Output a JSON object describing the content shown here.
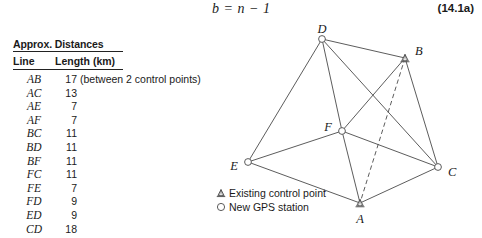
{
  "equation": {
    "formula": "b = n − 1",
    "number": "(14.1a)"
  },
  "table": {
    "title": "Approx. Distances",
    "headers": {
      "line": "Line",
      "length": "Length (km)"
    },
    "rows": [
      {
        "line": "AB",
        "length": "17",
        "note": "(between 2 control points)"
      },
      {
        "line": "AC",
        "length": "13",
        "note": ""
      },
      {
        "line": "AE",
        "length": "7",
        "note": ""
      },
      {
        "line": "AF",
        "length": "7",
        "note": ""
      },
      {
        "line": "BC",
        "length": "11",
        "note": ""
      },
      {
        "line": "BD",
        "length": "11",
        "note": ""
      },
      {
        "line": "BF",
        "length": "11",
        "note": ""
      },
      {
        "line": "FC",
        "length": "11",
        "note": ""
      },
      {
        "line": "FE",
        "length": "7",
        "note": ""
      },
      {
        "line": "FD",
        "length": "9",
        "note": ""
      },
      {
        "line": "ED",
        "length": "9",
        "note": ""
      },
      {
        "line": "CD",
        "length": "18",
        "note": ""
      }
    ]
  },
  "network": {
    "nodes": [
      {
        "id": "A",
        "label": "A",
        "type": "existing-control-point",
        "x": 150,
        "y": 187,
        "lx": 150,
        "ly": 204,
        "anchor": "middle"
      },
      {
        "id": "B",
        "label": "B",
        "type": "existing-control-point",
        "x": 195,
        "y": 42,
        "lx": 205,
        "ly": 36,
        "anchor": "start"
      },
      {
        "id": "C",
        "label": "C",
        "type": "new-gps-station",
        "x": 228,
        "y": 151,
        "lx": 238,
        "ly": 157,
        "anchor": "start"
      },
      {
        "id": "D",
        "label": "D",
        "type": "new-gps-station",
        "x": 112,
        "y": 23,
        "lx": 112,
        "ly": 14,
        "anchor": "middle"
      },
      {
        "id": "E",
        "label": "E",
        "type": "new-gps-station",
        "x": 38,
        "y": 146,
        "lx": 28,
        "ly": 151,
        "anchor": "end"
      },
      {
        "id": "F",
        "label": "F",
        "type": "new-gps-station",
        "x": 132,
        "y": 115,
        "lx": 122,
        "ly": 112,
        "anchor": "end"
      }
    ],
    "edges": [
      {
        "from": "D",
        "to": "B",
        "style": "solid"
      },
      {
        "from": "D",
        "to": "E",
        "style": "solid"
      },
      {
        "from": "D",
        "to": "F",
        "style": "solid"
      },
      {
        "from": "D",
        "to": "C",
        "style": "solid"
      },
      {
        "from": "B",
        "to": "F",
        "style": "solid"
      },
      {
        "from": "B",
        "to": "C",
        "style": "solid"
      },
      {
        "from": "B",
        "to": "A",
        "style": "dashed"
      },
      {
        "from": "F",
        "to": "E",
        "style": "solid"
      },
      {
        "from": "F",
        "to": "C",
        "style": "solid"
      },
      {
        "from": "F",
        "to": "A",
        "style": "solid"
      },
      {
        "from": "E",
        "to": "A",
        "style": "solid"
      },
      {
        "from": "A",
        "to": "C",
        "style": "solid"
      }
    ],
    "legend": [
      {
        "symbol": "triangle",
        "text": "Existing control point"
      },
      {
        "symbol": "circle",
        "text": "New GPS station"
      }
    ]
  },
  "colors": {
    "line": "#4a4a4a",
    "text": "#1a1a1a",
    "background": "#ffffff"
  }
}
